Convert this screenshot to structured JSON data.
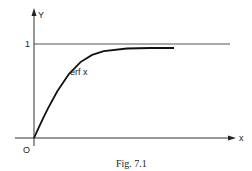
{
  "figure": {
    "caption": "Fig. 7.1"
  },
  "chart_data": {
    "type": "line",
    "title": "",
    "xlabel": "x",
    "ylabel": "Y",
    "origin_label": "O",
    "y_tick_labels": [
      "1"
    ],
    "grid": false,
    "legend": "none",
    "annotations": [
      "erf x"
    ],
    "reference_lines": [
      {
        "orientation": "horizontal",
        "y": 1
      }
    ],
    "series": [
      {
        "name": "erf x",
        "x": [
          0,
          0.1,
          0.2,
          0.3,
          0.5,
          0.75,
          1.0,
          1.25,
          1.5,
          2.0,
          2.5,
          3.0
        ],
        "values": [
          0,
          0.112,
          0.223,
          0.329,
          0.52,
          0.711,
          0.843,
          0.923,
          0.966,
          0.995,
          0.9996,
          1.0
        ]
      }
    ],
    "xlim": [
      0,
      3.4
    ],
    "ylim": [
      0,
      1.05
    ]
  },
  "colors": {
    "ink": "#222222",
    "background": "#ffffff"
  }
}
